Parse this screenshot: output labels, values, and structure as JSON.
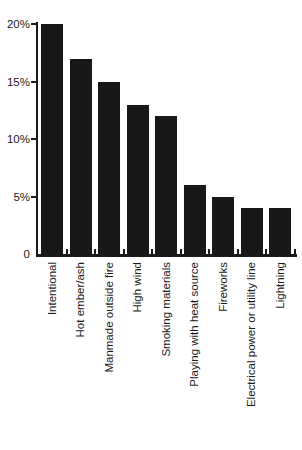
{
  "figure": {
    "background": "#ffffff"
  },
  "chart_data": {
    "type": "bar",
    "title": "",
    "xlabel": "",
    "ylabel": "",
    "categories": [
      "Intentional",
      "Hot ember/ash",
      "Manmade outside fire",
      "High wind",
      "Smoking materials",
      "Playing with heat source",
      "Fireworks",
      "Electrical power or utility line",
      "Lightning"
    ],
    "values": [
      20,
      17,
      15,
      13,
      12,
      6,
      5,
      4,
      4
    ],
    "unit": "%",
    "ylim": [
      0,
      20
    ],
    "y_ticks": [
      {
        "value": 20,
        "label": "20%"
      },
      {
        "value": 15,
        "label": "15%"
      },
      {
        "value": 10,
        "label": "10%"
      },
      {
        "value": 5,
        "label": "5%"
      },
      {
        "value": 0,
        "label": "0"
      }
    ],
    "grid": false,
    "legend": false,
    "bar_color": "#181818",
    "axis_color": "#1a1a1a",
    "text_color": "#1a1a1a"
  }
}
